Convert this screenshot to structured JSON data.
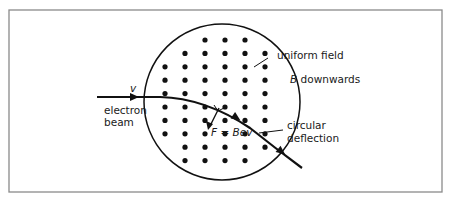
{
  "figure": {
    "frame": {
      "x": 9,
      "y": 10,
      "width": 433,
      "height": 182,
      "stroke": "#8a8a8a"
    },
    "region": {
      "shape": "circle",
      "cx": 222,
      "cy": 102,
      "r": 78,
      "stroke": "#111111"
    },
    "field": {
      "symbol": "dot",
      "meaning": "magnetic field B directed downwards (into view)",
      "grid": {
        "cols_x": [
          165,
          185,
          205,
          225,
          245,
          265
        ],
        "row_y_start": 40,
        "row_step": 13.4,
        "rows": 10,
        "dot_r": 2.6
      }
    },
    "beam": {
      "path": "M 97 97 L 160 97 Q 205 98 250 128 Q 275 148 302 168",
      "arrows": [
        {
          "x": 135,
          "y": 97,
          "angle": 0
        },
        {
          "x": 237,
          "y": 118,
          "angle": 34
        },
        {
          "x": 282,
          "y": 152,
          "angle": 38
        }
      ]
    },
    "force": {
      "from": [
        219,
        108
      ],
      "to": [
        209,
        128
      ],
      "right_angle_marker": true
    }
  },
  "labels": {
    "velocity": "v",
    "electron_beam_line1": "electron",
    "electron_beam_line2": "beam",
    "uniform_field": "uniform field",
    "b_symbol": "B",
    "b_downwards": " downwards",
    "force_F": "F",
    "force_eq": " = ",
    "force_expr": "Bev",
    "circular": "circular",
    "deflection": "deflection"
  }
}
